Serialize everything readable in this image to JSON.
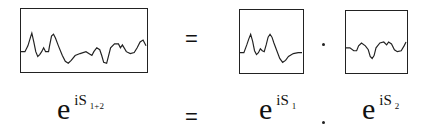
{
  "top_row": {
    "waveform_combined": {
      "label": "S 1+2 waveform"
    },
    "equals": "=",
    "waveform_1": {
      "label": "S 1 waveform"
    },
    "product": "·",
    "waveform_2": {
      "label": "S 2 waveform"
    }
  },
  "bottom_row": {
    "lhs": {
      "base": "e",
      "exponent": "iS",
      "subscript": "1+2"
    },
    "equals": "=",
    "term1": {
      "base": "e",
      "exponent": "iS",
      "subscript": "1"
    },
    "product": ".",
    "term2": {
      "base": "e",
      "exponent": "iS",
      "subscript": "2"
    }
  }
}
